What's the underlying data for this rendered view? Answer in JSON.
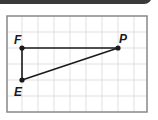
{
  "figure": {
    "type": "triangle-on-grid",
    "grid": {
      "columns": 8,
      "rows": 6
    },
    "points": [
      {
        "label": "F",
        "grid": [
          1,
          2
        ]
      },
      {
        "label": "P",
        "grid": [
          7,
          2
        ]
      },
      {
        "label": "E",
        "grid": [
          1,
          4
        ]
      }
    ],
    "segments": [
      [
        "F",
        "P"
      ],
      [
        "F",
        "E"
      ],
      [
        "E",
        "P"
      ]
    ],
    "colors": {
      "line": "#1a1a1a",
      "grid": "#d9d9d9",
      "frame": "#888888",
      "header": "#3a3a3a"
    }
  }
}
